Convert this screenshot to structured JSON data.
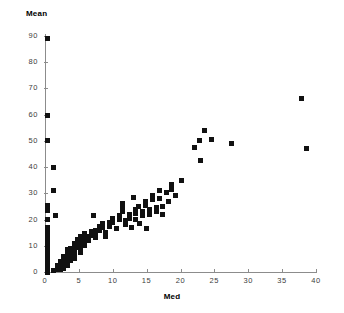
{
  "chart_data": {
    "type": "scatter",
    "title": "",
    "xlabel": "Med",
    "ylabel": "Mean",
    "xlim": [
      0,
      40
    ],
    "ylim": [
      0,
      90
    ],
    "xticks": [
      0,
      5,
      10,
      15,
      20,
      25,
      30,
      35,
      40
    ],
    "yticks": [
      0,
      10,
      20,
      30,
      40,
      50,
      60,
      70,
      80,
      90
    ],
    "xtick_labels": [
      "0",
      "5",
      "10",
      "15",
      "20",
      "25",
      "30",
      "35",
      "40"
    ],
    "ytick_labels": [
      "0",
      "10",
      "20",
      "30",
      "40",
      "50",
      "60",
      "70",
      "80",
      "90"
    ],
    "grid": false,
    "legend": null,
    "marker": "square",
    "marker_color": "#111111",
    "marker_size_px": 5,
    "axis_color": "#8c8c8c",
    "points": [
      [
        0.3,
        89.0
      ],
      [
        0.3,
        59.5
      ],
      [
        0.3,
        50.0
      ],
      [
        1.3,
        40.0
      ],
      [
        1.3,
        31.0
      ],
      [
        0.3,
        25.5
      ],
      [
        0.3,
        23.5
      ],
      [
        1.5,
        21.5
      ],
      [
        0.3,
        20.0
      ],
      [
        0.3,
        17.0
      ],
      [
        0.3,
        15.0
      ],
      [
        0.3,
        13.5
      ],
      [
        0.3,
        12.0
      ],
      [
        0.3,
        10.0
      ],
      [
        0.3,
        8.5
      ],
      [
        0.3,
        7.0
      ],
      [
        0.3,
        5.5
      ],
      [
        0.3,
        4.0
      ],
      [
        0.3,
        2.5
      ],
      [
        0.3,
        1.0
      ],
      [
        0.3,
        0.0
      ],
      [
        1.2,
        0.5
      ],
      [
        1.8,
        2.5
      ],
      [
        1.8,
        1.0
      ],
      [
        2.3,
        4.0
      ],
      [
        2.3,
        2.5
      ],
      [
        2.3,
        1.0
      ],
      [
        2.8,
        6.0
      ],
      [
        2.8,
        4.5
      ],
      [
        2.8,
        3.0
      ],
      [
        2.8,
        1.5
      ],
      [
        3.3,
        8.5
      ],
      [
        3.3,
        7.0
      ],
      [
        3.3,
        5.5
      ],
      [
        3.3,
        4.0
      ],
      [
        3.3,
        2.5
      ],
      [
        3.8,
        9.0
      ],
      [
        3.8,
        7.5
      ],
      [
        3.8,
        6.0
      ],
      [
        3.8,
        4.5
      ],
      [
        4.3,
        11.0
      ],
      [
        4.3,
        9.5
      ],
      [
        4.3,
        8.0
      ],
      [
        4.3,
        6.5
      ],
      [
        4.3,
        5.0
      ],
      [
        4.8,
        12.5
      ],
      [
        4.8,
        11.0
      ],
      [
        4.8,
        9.5
      ],
      [
        5.3,
        13.5
      ],
      [
        5.3,
        12.0
      ],
      [
        5.3,
        10.5
      ],
      [
        5.3,
        9.0
      ],
      [
        5.3,
        7.5
      ],
      [
        5.9,
        14.5
      ],
      [
        5.9,
        13.0
      ],
      [
        5.9,
        11.5
      ],
      [
        5.9,
        10.0
      ],
      [
        6.4,
        13.5
      ],
      [
        6.4,
        12.0
      ],
      [
        6.9,
        15.5
      ],
      [
        6.9,
        14.0
      ],
      [
        7.2,
        21.5
      ],
      [
        7.4,
        16.0
      ],
      [
        7.4,
        14.5
      ],
      [
        7.4,
        13.0
      ],
      [
        8.0,
        17.5
      ],
      [
        8.0,
        16.0
      ],
      [
        8.5,
        18.5
      ],
      [
        8.5,
        17.0
      ],
      [
        9.0,
        15.0
      ],
      [
        9.0,
        13.5
      ],
      [
        9.5,
        19.0
      ],
      [
        9.5,
        17.5
      ],
      [
        10.0,
        20.5
      ],
      [
        10.0,
        19.0
      ],
      [
        10.5,
        16.5
      ],
      [
        11.0,
        21.5
      ],
      [
        11.0,
        20.0
      ],
      [
        11.4,
        26.0
      ],
      [
        11.4,
        24.5
      ],
      [
        11.4,
        23.0
      ],
      [
        11.9,
        19.5
      ],
      [
        11.9,
        18.0
      ],
      [
        12.4,
        22.0
      ],
      [
        12.4,
        20.5
      ],
      [
        12.8,
        17.0
      ],
      [
        13.0,
        28.5
      ],
      [
        13.3,
        24.0
      ],
      [
        13.3,
        22.5
      ],
      [
        13.3,
        20.0
      ],
      [
        13.8,
        25.0
      ],
      [
        14.0,
        18.5
      ],
      [
        14.4,
        23.0
      ],
      [
        14.4,
        21.5
      ],
      [
        14.9,
        27.0
      ],
      [
        14.9,
        25.5
      ],
      [
        15.0,
        16.5
      ],
      [
        15.4,
        24.0
      ],
      [
        15.4,
        22.0
      ],
      [
        15.9,
        29.0
      ],
      [
        15.9,
        27.5
      ],
      [
        16.4,
        24.5
      ],
      [
        16.4,
        23.0
      ],
      [
        16.9,
        31.0
      ],
      [
        16.9,
        28.0
      ],
      [
        17.4,
        25.0
      ],
      [
        17.4,
        22.0
      ],
      [
        17.9,
        30.5
      ],
      [
        18.2,
        27.0
      ],
      [
        18.6,
        33.5
      ],
      [
        18.6,
        31.5
      ],
      [
        19.2,
        29.0
      ],
      [
        20.2,
        35.0
      ],
      [
        22.0,
        47.5
      ],
      [
        22.8,
        50.0
      ],
      [
        23.6,
        54.0
      ],
      [
        24.6,
        50.5
      ],
      [
        23.0,
        42.5
      ],
      [
        27.5,
        49.0
      ],
      [
        37.9,
        66.0
      ],
      [
        38.6,
        47.0
      ]
    ]
  }
}
